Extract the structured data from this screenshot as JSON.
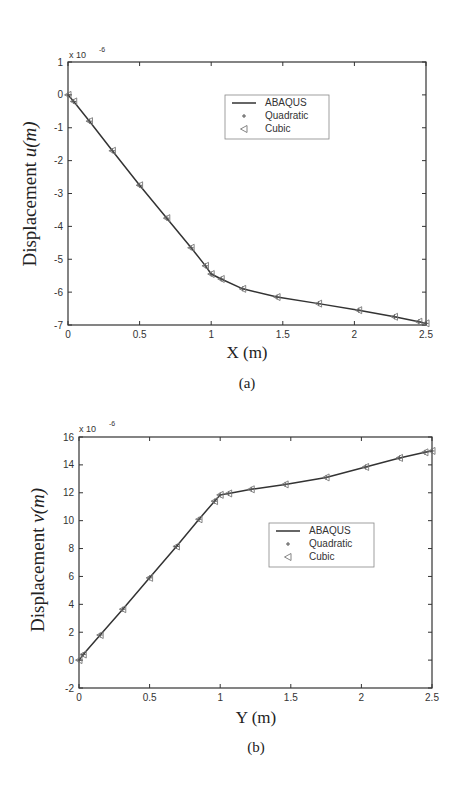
{
  "chart_data": [
    {
      "panel": "(a)",
      "type": "line",
      "title": "",
      "xlabel": "X  (m)",
      "ylabel_prefix": "Displacement ",
      "ylabel_var": "u(m)",
      "y_multiplier": "x 10",
      "y_exponent": "-6",
      "xlim": [
        0,
        2.5
      ],
      "ylim": [
        -7,
        1
      ],
      "xticks": [
        "0",
        "0.5",
        "1",
        "1.5",
        "2",
        "2.5"
      ],
      "yticks": [
        "1",
        "0",
        "-1",
        "-2",
        "-3",
        "-4",
        "-5",
        "-6",
        "-7"
      ],
      "grid": false,
      "legend_position": "upper right inside",
      "legend": [
        "ABAQUS",
        "Quadratic",
        "Cubic"
      ],
      "series": [
        {
          "name": "ABAQUS",
          "style": "line",
          "x": [
            0,
            0.04,
            0.15,
            0.31,
            0.5,
            0.69,
            0.86,
            0.96,
            1.0,
            1.07,
            1.22,
            1.46,
            1.75,
            2.03,
            2.28,
            2.45,
            2.5
          ],
          "y": [
            0,
            -0.2,
            -0.8,
            -1.7,
            -2.75,
            -3.75,
            -4.65,
            -5.2,
            -5.45,
            -5.6,
            -5.9,
            -6.15,
            -6.35,
            -6.55,
            -6.75,
            -6.9,
            -6.95
          ]
        },
        {
          "name": "Quadratic",
          "style": "plus-marker",
          "x": [
            0,
            0.04,
            0.15,
            0.31,
            0.5,
            0.69,
            0.86,
            0.96,
            1.0,
            1.07,
            1.22,
            1.46,
            1.75,
            2.03,
            2.28,
            2.45,
            2.5
          ],
          "y": [
            0,
            -0.2,
            -0.8,
            -1.7,
            -2.75,
            -3.75,
            -4.65,
            -5.2,
            -5.45,
            -5.6,
            -5.9,
            -6.15,
            -6.35,
            -6.55,
            -6.75,
            -6.9,
            -6.95
          ]
        },
        {
          "name": "Cubic",
          "style": "left-triangle-marker",
          "x": [
            0,
            0.04,
            0.15,
            0.31,
            0.5,
            0.69,
            0.86,
            0.96,
            1.0,
            1.07,
            1.22,
            1.46,
            1.75,
            2.03,
            2.28,
            2.45,
            2.5
          ],
          "y": [
            0,
            -0.2,
            -0.8,
            -1.7,
            -2.75,
            -3.75,
            -4.65,
            -5.2,
            -5.45,
            -5.6,
            -5.9,
            -6.15,
            -6.35,
            -6.55,
            -6.75,
            -6.9,
            -6.95
          ]
        }
      ]
    },
    {
      "panel": "(b)",
      "type": "line",
      "title": "",
      "xlabel": "Y (m)",
      "ylabel_prefix": "Displacement ",
      "ylabel_var": "v(m)",
      "y_multiplier": "x 10",
      "y_exponent": "-6",
      "xlim": [
        0,
        2.5
      ],
      "ylim": [
        -2,
        16
      ],
      "xticks": [
        "0",
        "0.5",
        "1",
        "1.5",
        "2",
        "2.5"
      ],
      "yticks": [
        "16",
        "14",
        "12",
        "10",
        "8",
        "6",
        "4",
        "2",
        "0",
        "-2"
      ],
      "grid": false,
      "legend_position": "center right inside",
      "legend": [
        "ABAQUS",
        "Quadratic",
        "Cubic"
      ],
      "series": [
        {
          "name": "ABAQUS",
          "style": "line",
          "x": [
            0,
            0.03,
            0.15,
            0.31,
            0.5,
            0.69,
            0.85,
            0.96,
            1.0,
            1.06,
            1.22,
            1.46,
            1.75,
            2.03,
            2.27,
            2.45,
            2.5
          ],
          "y": [
            0,
            0.4,
            1.8,
            3.65,
            5.9,
            8.15,
            10.1,
            11.4,
            11.85,
            11.95,
            12.25,
            12.6,
            13.1,
            13.85,
            14.5,
            14.9,
            15.0
          ]
        },
        {
          "name": "Quadratic",
          "style": "plus-marker",
          "x": [
            0,
            0.03,
            0.15,
            0.31,
            0.5,
            0.69,
            0.85,
            0.96,
            1.0,
            1.06,
            1.22,
            1.46,
            1.75,
            2.03,
            2.27,
            2.45,
            2.5
          ],
          "y": [
            0,
            0.4,
            1.8,
            3.65,
            5.9,
            8.15,
            10.1,
            11.4,
            11.85,
            11.95,
            12.25,
            12.6,
            13.1,
            13.85,
            14.5,
            14.9,
            15.0
          ]
        },
        {
          "name": "Cubic",
          "style": "left-triangle-marker",
          "x": [
            0,
            0.03,
            0.15,
            0.31,
            0.5,
            0.69,
            0.85,
            0.96,
            1.0,
            1.06,
            1.22,
            1.46,
            1.75,
            2.03,
            2.27,
            2.45,
            2.5
          ],
          "y": [
            0,
            0.4,
            1.8,
            3.65,
            5.9,
            8.15,
            10.1,
            11.4,
            11.85,
            11.95,
            12.25,
            12.6,
            13.1,
            13.85,
            14.5,
            14.9,
            15.0
          ]
        }
      ]
    }
  ],
  "colors": {
    "line": "#333333",
    "marker": "#555555",
    "axis": "#333333",
    "legend_border": "#888888"
  },
  "captions": {
    "a": "(a)",
    "b": "(b)"
  }
}
